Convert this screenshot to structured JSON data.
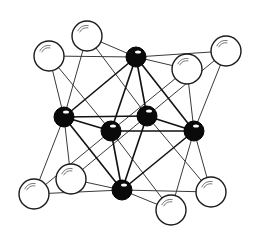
{
  "diagram": {
    "title": "",
    "type": "octahedral cluster (6 central atoms at octahedron vertices, 8 face-capping atoms at cube corners)",
    "colors": {
      "background": "#ffffff",
      "black_atom": "#0a0a0a",
      "white_atom_fill": "#ffffff",
      "outline": "#1a1a1a",
      "thin_bond": "#3a3a3a",
      "thick_bond": "#111111"
    },
    "black_atoms": [
      {
        "id": "top",
        "x": 136,
        "y": 57,
        "r": 10
      },
      {
        "id": "bottom",
        "x": 122,
        "y": 190,
        "r": 10
      },
      {
        "id": "left",
        "x": 64,
        "y": 117,
        "r": 10
      },
      {
        "id": "right",
        "x": 194,
        "y": 131,
        "r": 10
      },
      {
        "id": "front",
        "x": 111,
        "y": 131,
        "r": 10
      },
      {
        "id": "back",
        "x": 147,
        "y": 116,
        "r": 10
      }
    ],
    "white_atoms": [
      {
        "id": "tl_back",
        "x": 87,
        "y": 36,
        "r": 15,
        "links": [
          "top",
          "left",
          "back"
        ]
      },
      {
        "id": "tl_front",
        "x": 49,
        "y": 56,
        "r": 15,
        "links": [
          "top",
          "left",
          "front"
        ]
      },
      {
        "id": "tr_front",
        "x": 187,
        "y": 69,
        "r": 15,
        "links": [
          "top",
          "right",
          "front"
        ]
      },
      {
        "id": "tr_back",
        "x": 226,
        "y": 51,
        "r": 15,
        "links": [
          "top",
          "right",
          "back"
        ]
      },
      {
        "id": "bl_back",
        "x": 71,
        "y": 179,
        "r": 15,
        "links": [
          "bottom",
          "left",
          "back"
        ]
      },
      {
        "id": "bl_front",
        "x": 34,
        "y": 194,
        "r": 15,
        "links": [
          "bottom",
          "left",
          "front"
        ]
      },
      {
        "id": "br_front",
        "x": 171,
        "y": 210,
        "r": 15,
        "links": [
          "bottom",
          "right",
          "front"
        ]
      },
      {
        "id": "br_back",
        "x": 211,
        "y": 192,
        "r": 15,
        "links": [
          "bottom",
          "right",
          "back"
        ]
      }
    ],
    "octahedron_edges": [
      [
        "top",
        "left"
      ],
      [
        "top",
        "right"
      ],
      [
        "top",
        "front"
      ],
      [
        "top",
        "back"
      ],
      [
        "bottom",
        "left"
      ],
      [
        "bottom",
        "right"
      ],
      [
        "bottom",
        "front"
      ],
      [
        "bottom",
        "back"
      ],
      [
        "left",
        "front"
      ],
      [
        "left",
        "back"
      ],
      [
        "right",
        "front"
      ],
      [
        "right",
        "back"
      ]
    ]
  }
}
